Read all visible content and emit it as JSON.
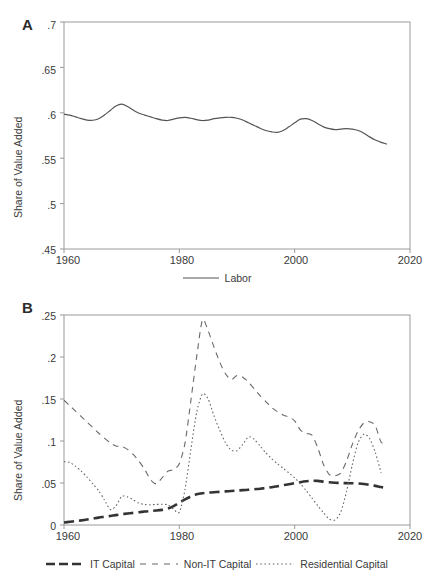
{
  "figure": {
    "width": 437,
    "height": 587,
    "line_color": "#555555",
    "axis_color": "#9a9a9a",
    "text_color": "#3a3a3a"
  },
  "panel_a": {
    "letter": "A",
    "ylabel": "Share of Value Added",
    "yticks": [
      ".45",
      ".5",
      ".55",
      ".6",
      ".65",
      ".7"
    ],
    "xticks": [
      "1960",
      "1980",
      "2000",
      "2020"
    ],
    "legend": [
      {
        "label": "Labor",
        "style": "solid",
        "icon": "line-swatch-solid"
      }
    ]
  },
  "panel_b": {
    "letter": "B",
    "ylabel": "Share of Value Added",
    "yticks": [
      "0",
      ".05",
      ".1",
      ".15",
      ".2",
      ".25"
    ],
    "xticks": [
      "1960",
      "1980",
      "2000",
      "2020"
    ],
    "legend": [
      {
        "label": "IT Capital",
        "style": "long-dash",
        "icon": "line-swatch-long-dash"
      },
      {
        "label": "Non-IT Capital",
        "style": "dash",
        "icon": "line-swatch-dash"
      },
      {
        "label": "Residential Capital",
        "style": "dotted",
        "icon": "line-swatch-dotted"
      }
    ]
  },
  "chart_data": [
    {
      "type": "line",
      "panel": "A",
      "title": "",
      "xlabel": "",
      "ylabel": "Share of Value Added",
      "xlim": [
        1960,
        2020
      ],
      "ylim": [
        0.45,
        0.7
      ],
      "yticks": [
        0.45,
        0.5,
        0.55,
        0.6,
        0.65,
        0.7
      ],
      "xticks": [
        1960,
        1980,
        2000,
        2020
      ],
      "grid": false,
      "legend_position": "below",
      "x": [
        1960,
        1961,
        1962,
        1963,
        1964,
        1965,
        1966,
        1967,
        1968,
        1969,
        1970,
        1971,
        1972,
        1973,
        1974,
        1975,
        1976,
        1977,
        1978,
        1979,
        1980,
        1981,
        1982,
        1983,
        1984,
        1985,
        1986,
        1987,
        1988,
        1989,
        1990,
        1991,
        1992,
        1993,
        1994,
        1995,
        1996,
        1997,
        1998,
        1999,
        2000,
        2001,
        2002,
        2003,
        2004,
        2005,
        2006,
        2007,
        2008,
        2009,
        2010,
        2011,
        2012,
        2013,
        2014,
        2015,
        2016
      ],
      "series": [
        {
          "name": "Labor",
          "style": "solid",
          "values": [
            0.5985,
            0.5975,
            0.5955,
            0.5935,
            0.592,
            0.5918,
            0.5935,
            0.5975,
            0.6025,
            0.6075,
            0.6095,
            0.607,
            0.603,
            0.5995,
            0.5975,
            0.5955,
            0.5935,
            0.592,
            0.5915,
            0.593,
            0.5945,
            0.595,
            0.594,
            0.5925,
            0.5915,
            0.592,
            0.5935,
            0.5945,
            0.595,
            0.595,
            0.594,
            0.592,
            0.589,
            0.586,
            0.583,
            0.5805,
            0.579,
            0.5785,
            0.5805,
            0.5845,
            0.589,
            0.593,
            0.5935,
            0.5915,
            0.588,
            0.5845,
            0.5825,
            0.5815,
            0.582,
            0.5825,
            0.582,
            0.5805,
            0.5775,
            0.5735,
            0.57,
            0.5675,
            0.5655
          ]
        }
      ]
    },
    {
      "type": "line",
      "panel": "B",
      "title": "",
      "xlabel": "",
      "ylabel": "Share of Value Added",
      "xlim": [
        1960,
        2020
      ],
      "ylim": [
        0.0,
        0.25
      ],
      "yticks": [
        0,
        0.05,
        0.1,
        0.15,
        0.2,
        0.25
      ],
      "xticks": [
        1960,
        1980,
        2000,
        2020
      ],
      "grid": false,
      "legend_position": "below",
      "x": [
        1960,
        1961,
        1962,
        1963,
        1964,
        1965,
        1966,
        1967,
        1968,
        1969,
        1970,
        1971,
        1972,
        1973,
        1974,
        1975,
        1976,
        1977,
        1978,
        1979,
        1980,
        1981,
        1982,
        1983,
        1984,
        1985,
        1986,
        1987,
        1988,
        1989,
        1990,
        1991,
        1992,
        1993,
        1994,
        1995,
        1996,
        1997,
        1998,
        1999,
        2000,
        2001,
        2002,
        2003,
        2004,
        2005,
        2006,
        2007,
        2008,
        2009,
        2010,
        2011,
        2012,
        2013,
        2014,
        2015,
        2016
      ],
      "series": [
        {
          "name": "IT Capital",
          "style": "long-dash",
          "values": [
            0.003,
            0.0038,
            0.0046,
            0.0055,
            0.0065,
            0.0076,
            0.0088,
            0.0098,
            0.0108,
            0.0118,
            0.0128,
            0.0136,
            0.0144,
            0.0152,
            0.016,
            0.0166,
            0.0172,
            0.018,
            0.0195,
            0.0225,
            0.0265,
            0.0305,
            0.034,
            0.0365,
            0.0378,
            0.0385,
            0.039,
            0.0395,
            0.04,
            0.0405,
            0.041,
            0.0415,
            0.042,
            0.0426,
            0.0432,
            0.044,
            0.045,
            0.0462,
            0.0474,
            0.0486,
            0.0498,
            0.051,
            0.052,
            0.0527,
            0.0525,
            0.0516,
            0.0508,
            0.0503,
            0.05,
            0.0498,
            0.0497,
            0.0494,
            0.0488,
            0.0478,
            0.0466,
            0.0452,
            0.044
          ]
        },
        {
          "name": "Non-IT Capital",
          "style": "dash",
          "values": [
            0.1485,
            0.142,
            0.1355,
            0.129,
            0.1225,
            0.116,
            0.1095,
            0.1035,
            0.098,
            0.094,
            0.0935,
            0.09,
            0.084,
            0.076,
            0.066,
            0.054,
            0.049,
            0.056,
            0.064,
            0.066,
            0.073,
            0.098,
            0.148,
            0.2,
            0.244,
            0.231,
            0.212,
            0.194,
            0.18,
            0.173,
            0.178,
            0.176,
            0.17,
            0.162,
            0.154,
            0.147,
            0.14,
            0.135,
            0.131,
            0.1285,
            0.124,
            0.113,
            0.109,
            0.107,
            0.092,
            0.072,
            0.06,
            0.0585,
            0.062,
            0.076,
            0.096,
            0.112,
            0.1215,
            0.123,
            0.118,
            0.0985,
            0.099
          ]
        },
        {
          "name": "Residential Capital",
          "style": "dotted",
          "values": [
            0.0755,
            0.0745,
            0.07,
            0.064,
            0.057,
            0.049,
            0.041,
            0.03,
            0.0185,
            0.0225,
            0.034,
            0.0335,
            0.03,
            0.026,
            0.0245,
            0.024,
            0.0245,
            0.0246,
            0.024,
            0.019,
            0.0152,
            0.043,
            0.09,
            0.134,
            0.156,
            0.15,
            0.13,
            0.113,
            0.098,
            0.089,
            0.0885,
            0.096,
            0.105,
            0.102,
            0.094,
            0.086,
            0.079,
            0.073,
            0.0675,
            0.062,
            0.056,
            0.049,
            0.041,
            0.032,
            0.023,
            0.0145,
            0.007,
            0.006,
            0.0155,
            0.04,
            0.072,
            0.098,
            0.108,
            0.103,
            0.086,
            0.062,
            0.038,
            0.01,
            0.0
          ]
        }
      ]
    }
  ]
}
